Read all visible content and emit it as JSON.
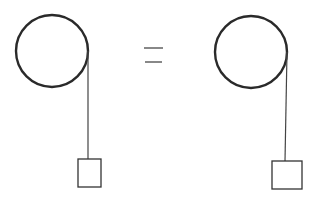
{
  "diagram": {
    "colors": {
      "background": "#ffffff",
      "stroke": "#2a2a2a",
      "string": "#444444"
    },
    "left_system": {
      "pulley": {
        "cx": 52,
        "cy": 51,
        "r": 36
      },
      "string": {
        "x1": 88,
        "y1": 51,
        "x2": 88,
        "y2": 159
      },
      "block": {
        "x": 78,
        "y": 159,
        "width": 23,
        "height": 28
      }
    },
    "equals_sign": {
      "line1": {
        "x1": 144,
        "y1": 48,
        "x2": 163,
        "y2": 48
      },
      "line2": {
        "x1": 145,
        "y1": 62,
        "x2": 162,
        "y2": 62
      }
    },
    "right_system": {
      "pulley": {
        "cx": 251,
        "cy": 52,
        "r": 36
      },
      "string": {
        "x1": 287,
        "y1": 52,
        "x2": 285,
        "y2": 161
      },
      "block": {
        "x": 272,
        "y": 161,
        "width": 30,
        "height": 28
      }
    }
  }
}
